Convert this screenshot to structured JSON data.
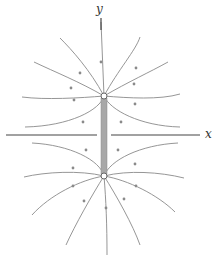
{
  "diagram": {
    "axes": {
      "x_label": "x",
      "y_label": "y"
    },
    "nodes": [
      {
        "id": "upper-node",
        "x": 104,
        "y": 96
      },
      {
        "id": "lower-node",
        "x": 104,
        "y": 176
      }
    ],
    "connector": {
      "description": "thick gray bar joining the two nodes along the y axis",
      "from": "upper-node",
      "to": "lower-node"
    },
    "field_lines": {
      "upper_node_count": 10,
      "lower_node_count": 10,
      "arrow_direction": "not determined from screenshot (arrowheads too small to resolve)"
    },
    "colors": {
      "line": "#8a8a8a",
      "axis": "#444444",
      "bar": "#a8a8a8",
      "node_fill": "#ffffff",
      "node_stroke": "#666666"
    }
  }
}
